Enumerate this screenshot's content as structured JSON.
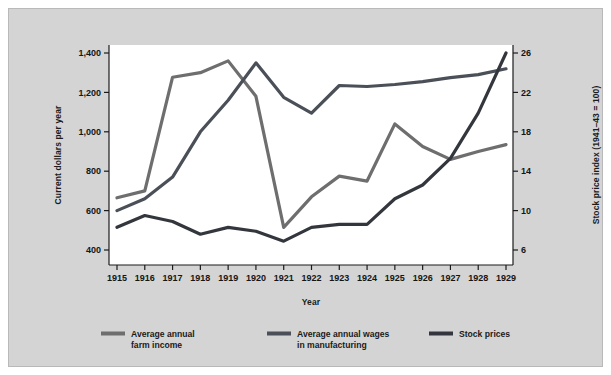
{
  "chart_data": {
    "type": "line",
    "title": "",
    "xlabel": "Year",
    "ylabel": "Current dollars per year",
    "y2label": "Stock price index (1941–43 = 100)",
    "x": [
      1915,
      1916,
      1917,
      1918,
      1919,
      1920,
      1921,
      1922,
      1923,
      1924,
      1925,
      1926,
      1927,
      1928,
      1929
    ],
    "categories": [
      "1915",
      "1916",
      "1917",
      "1918",
      "1919",
      "1920",
      "1921",
      "1922",
      "1923",
      "1924",
      "1925",
      "1926",
      "1927",
      "1928",
      "1929"
    ],
    "ylim": [
      300,
      1400
    ],
    "y2lim": [
      4,
      26
    ],
    "yticks": [
      400,
      600,
      800,
      1000,
      1200,
      1400
    ],
    "ytick_labels": [
      "400",
      "600",
      "800",
      "1,000",
      "1,200",
      "1,400"
    ],
    "y2ticks": [
      6,
      10,
      14,
      18,
      22,
      26
    ],
    "y2tick_labels": [
      "6",
      "10",
      "14",
      "18",
      "22",
      "26"
    ],
    "grid": false,
    "legend_position": "bottom",
    "series": [
      {
        "name": "Average annual\nfarm income",
        "label_line1": "Average annual",
        "label_line2": "farm income",
        "axis": "left",
        "color": "#6e6e6e",
        "values": [
          665,
          700,
          1277,
          1300,
          1360,
          1180,
          515,
          670,
          775,
          750,
          1040,
          925,
          860,
          900,
          935
        ]
      },
      {
        "name": "Average annual wages\nin manufacturing",
        "label_line1": "Average annual wages",
        "label_line2": "in manufacturing",
        "axis": "left",
        "color": "#4a4f58",
        "values": [
          600,
          660,
          770,
          1000,
          1160,
          1350,
          1175,
          1095,
          1235,
          1230,
          1240,
          1255,
          1275,
          1290,
          1320
        ]
      },
      {
        "name": "Stock prices",
        "label_line1": "Stock prices",
        "label_line2": "",
        "axis": "right",
        "color": "#33373d",
        "values": [
          8.3,
          9.5,
          8.9,
          7.6,
          8.3,
          7.9,
          6.9,
          8.3,
          8.6,
          8.6,
          11.2,
          12.6,
          15.3,
          19.9,
          26.0
        ]
      }
    ]
  }
}
